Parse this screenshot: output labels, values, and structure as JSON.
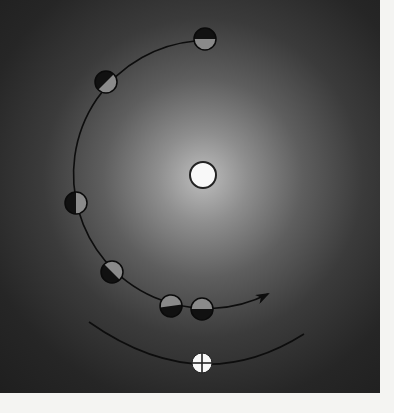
{
  "diagram": {
    "type": "moon-phases-orbit",
    "background": {
      "color_center": "#bdbdbd",
      "color_edge": "#1c1c1c"
    },
    "sun": {
      "label": "sun",
      "cx": 203,
      "cy": 175,
      "r": 13,
      "fill": "#f8f8f8",
      "stroke": "#222222"
    },
    "earth": {
      "label": "earth",
      "symbol": "⊕",
      "cx": 202,
      "cy": 363,
      "r": 10,
      "fill": "#f8f8f8",
      "stroke": "#222222"
    },
    "orbit_path": {
      "label": "moon-orbit-arc",
      "direction": "counterclockwise-to-arrow",
      "arrow_tip": [
        268,
        294
      ]
    },
    "earth_path": {
      "label": "earth-orbit-arc"
    },
    "moons": [
      {
        "id": 1,
        "cx": 205,
        "cy": 39,
        "r": 11,
        "dark_side_angle": 0
      },
      {
        "id": 2,
        "cx": 106,
        "cy": 82,
        "r": 11,
        "dark_side_angle": -45
      },
      {
        "id": 3,
        "cx": 76,
        "cy": 203,
        "r": 11,
        "dark_side_angle": -90
      },
      {
        "id": 4,
        "cx": 112,
        "cy": 272,
        "r": 11,
        "dark_side_angle": -135
      },
      {
        "id": 5,
        "cx": 171,
        "cy": 306,
        "r": 11,
        "dark_side_angle": 172
      },
      {
        "id": 6,
        "cx": 202,
        "cy": 309,
        "r": 11,
        "dark_side_angle": 180
      }
    ],
    "colors": {
      "moon_dark": "#111111",
      "moon_lit": "#8a8a8a",
      "line": "#0d0d0d"
    }
  },
  "caption": {
    "text": ""
  }
}
